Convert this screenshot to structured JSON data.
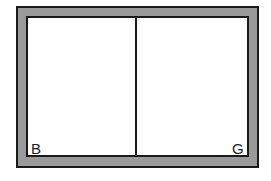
{
  "diagram": {
    "colors": {
      "border_fill": "#9a9a9a",
      "line": "#1a1a1a",
      "interior": "#ffffff"
    },
    "compartments": [
      {
        "label": "B"
      },
      {
        "label": "G"
      }
    ]
  }
}
